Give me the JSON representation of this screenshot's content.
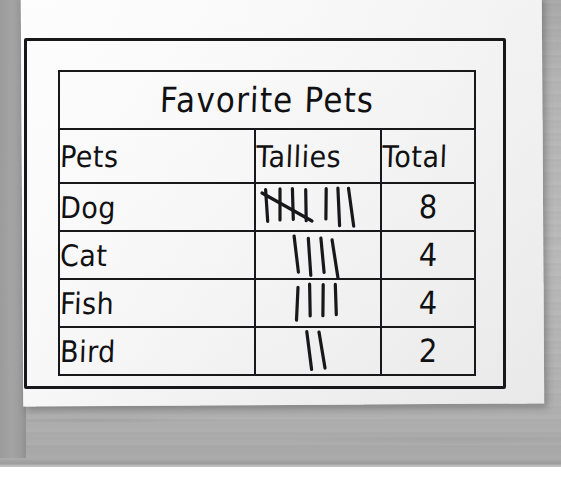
{
  "scene": {
    "surface": "wooden-desk",
    "surface_color": "#b2b2b2",
    "paper_color": "#f7f7f7",
    "ink_color": "#18181a"
  },
  "poster": {
    "title": "Favorite Pets"
  },
  "chart_data": {
    "type": "table",
    "title": "Favorite Pets",
    "columns": [
      "Pets",
      "Tallies",
      "Total"
    ],
    "categories": [
      "Dog",
      "Cat",
      "Fish",
      "Bird"
    ],
    "values": [
      8,
      4,
      4,
      2
    ],
    "rows": [
      {
        "pet": "Dog",
        "tally_groups": [
          5,
          3
        ],
        "tally_marks": 8,
        "total": "8"
      },
      {
        "pet": "Cat",
        "tally_groups": [
          4
        ],
        "tally_marks": 4,
        "total": "4"
      },
      {
        "pet": "Fish",
        "tally_groups": [
          4
        ],
        "tally_marks": 4,
        "total": "4"
      },
      {
        "pet": "Bird",
        "tally_groups": [
          2
        ],
        "tally_marks": 2,
        "total": "2"
      }
    ],
    "xlabel": "Pets",
    "ylabel": "Total"
  }
}
